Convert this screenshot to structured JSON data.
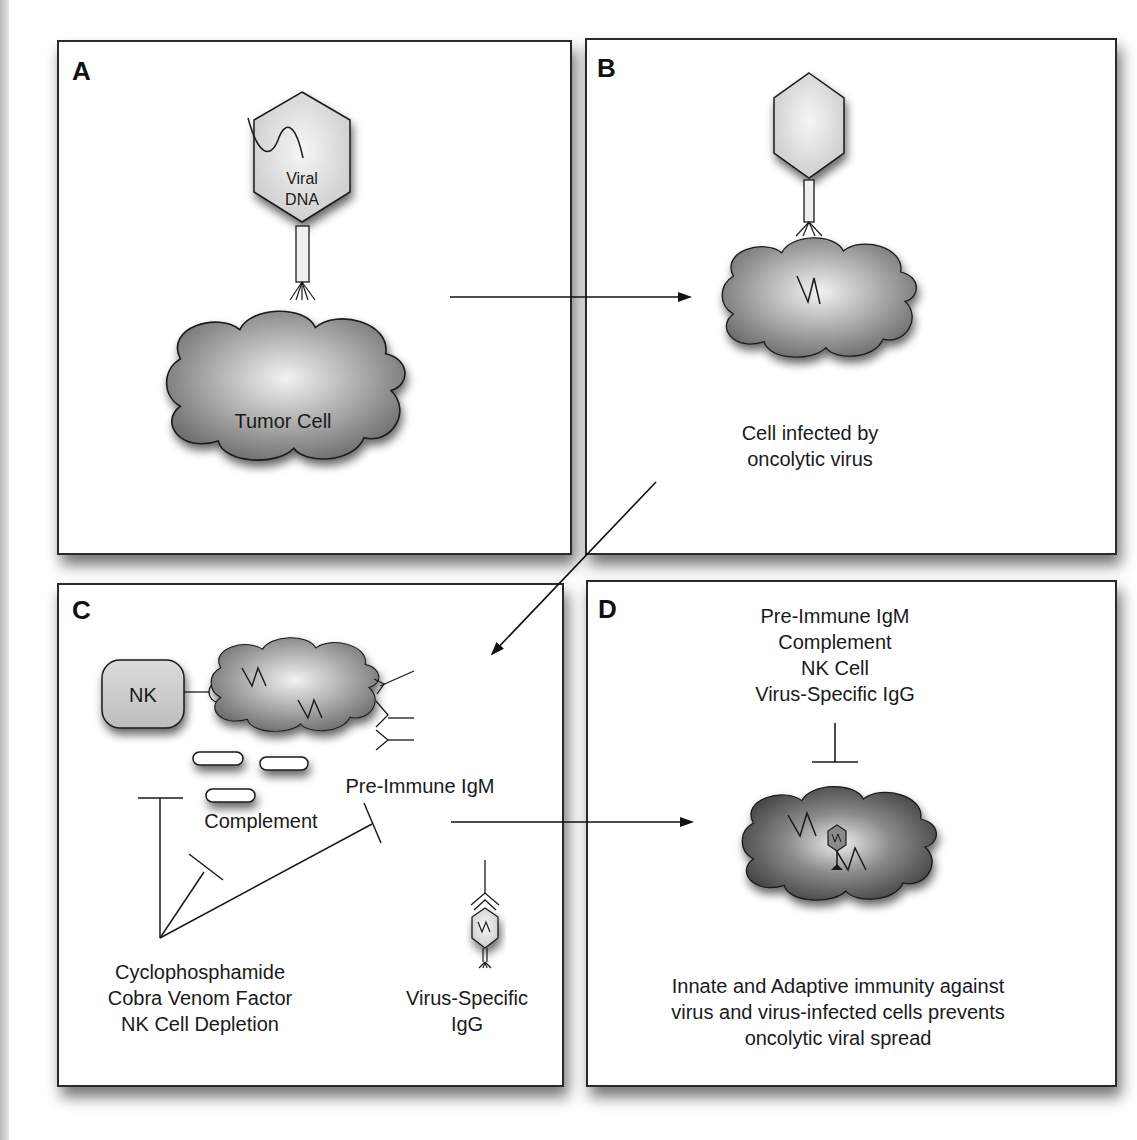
{
  "figure": {
    "panels": [
      {
        "id": "A",
        "letter": "A",
        "labels": {
          "virus": "Viral\nDNA",
          "virus_line1": "Viral",
          "virus_line2": "DNA",
          "cell": "Tumor Cell"
        }
      },
      {
        "id": "B",
        "letter": "B",
        "labels": {
          "caption_line1": "Cell infected by",
          "caption_line2": "oncolytic virus"
        }
      },
      {
        "id": "C",
        "letter": "C",
        "labels": {
          "nk": "NK",
          "complement": "Complement",
          "igm": "Pre-Immune IgM",
          "treatments": [
            "Cyclophosphamide",
            "Cobra Venom Factor",
            "NK Cell Depletion"
          ],
          "igg_line1": "Virus-Specific",
          "igg_line2": "IgG"
        }
      },
      {
        "id": "D",
        "letter": "D",
        "labels": {
          "factors": [
            "Pre-Immune IgM",
            "Complement",
            "NK Cell",
            "Virus-Specific IgG"
          ],
          "caption": [
            "Innate and Adaptive immunity against",
            "virus and virus-infected cells prevents",
            "oncolytic viral spread"
          ]
        }
      }
    ],
    "colors": {
      "border": "#2a2a2a",
      "cell_dark": "#6e6e6e",
      "cell_light": "#f0f0f0",
      "virus_fill": "#e4e4e4"
    }
  }
}
